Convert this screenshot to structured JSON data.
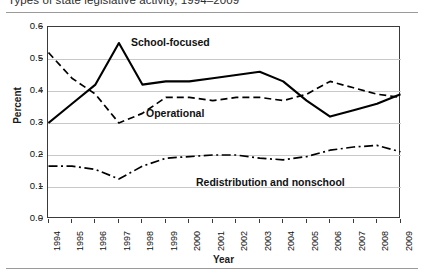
{
  "figure": {
    "title": "Types of state legislative activity, 1994–2009"
  },
  "axes": {
    "ylabel": "Percent",
    "xlabel": "Year",
    "yticks": [
      "0.0",
      "0.1",
      "0.2",
      "0.3",
      "0.4",
      "0.5",
      "0.6"
    ],
    "xticks": [
      "1994",
      "1995",
      "1996",
      "1997",
      "1998",
      "1999",
      "2000",
      "2001",
      "2002",
      "2003",
      "2004",
      "2005",
      "2006",
      "2007",
      "2008",
      "2009"
    ]
  },
  "labels": {
    "school": "School-focused",
    "operational": "Operational",
    "redistribution": "Redistribution and nonschool"
  },
  "colors": {
    "line": "#000000",
    "grid": "#c8c8c8",
    "frame": "#3a3a3a",
    "rule": "#9a9a9a"
  },
  "chart_data": {
    "type": "line",
    "title": "Types of state legislative activity, 1994–2009",
    "xlabel": "Year",
    "ylabel": "Percent",
    "xlim": [
      1994,
      2009
    ],
    "ylim": [
      0.0,
      0.6
    ],
    "ytick_step": 0.1,
    "grid": true,
    "legend": "inline-labels",
    "x": [
      1994,
      1995,
      1996,
      1997,
      1998,
      1999,
      2000,
      2001,
      2002,
      2003,
      2004,
      2005,
      2006,
      2007,
      2008,
      2009
    ],
    "series": [
      {
        "name": "School-focused",
        "style": "solid",
        "values": [
          0.3,
          0.36,
          0.42,
          0.55,
          0.42,
          0.43,
          0.43,
          0.44,
          0.45,
          0.46,
          0.43,
          0.37,
          0.32,
          0.34,
          0.36,
          0.39
        ]
      },
      {
        "name": "Operational",
        "style": "dashed",
        "values": [
          0.52,
          0.44,
          0.39,
          0.3,
          0.33,
          0.38,
          0.38,
          0.37,
          0.38,
          0.38,
          0.37,
          0.39,
          0.43,
          0.41,
          0.39,
          0.38
        ]
      },
      {
        "name": "Redistribution and nonschool",
        "style": "dashdot",
        "values": [
          0.165,
          0.165,
          0.155,
          0.125,
          0.165,
          0.19,
          0.195,
          0.2,
          0.2,
          0.19,
          0.185,
          0.195,
          0.215,
          0.225,
          0.23,
          0.21
        ]
      }
    ]
  }
}
